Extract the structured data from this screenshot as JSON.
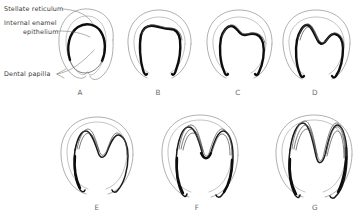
{
  "figure": {
    "background_color": "#ffffff",
    "ink_color": "#0d0d0d",
    "outline_color": "#8d8d8d",
    "label_color": "#3a3a3a",
    "letter_color": "#6a6a6a"
  },
  "annotations": [
    {
      "id": "stellate-reticulum",
      "text": "Stellate reticulum",
      "x": 4,
      "y": 10,
      "leader": "M 62 8 C 76 9, 86 14, 92 22"
    },
    {
      "id": "internal-enamel-epithelium",
      "text_line1": "Internal enamel",
      "text_line2": "epithelium",
      "x1": 4,
      "y1": 24,
      "x2": 24,
      "y2": 33,
      "leader": "M 61 30 C 74 30, 82 32, 88 36"
    },
    {
      "id": "dental-papilla",
      "text": "Dental papilla",
      "x": 4,
      "y": 75,
      "leader": "M 60 73 C 72 71, 84 62, 94 50"
    }
  ],
  "panels": [
    {
      "letter": "A",
      "name": "cap-stage",
      "letter_x": 80,
      "letter_y": 95,
      "description": "Cap stage: rounded enamel organ with thick arched internal enamel epithelium over the dental papilla."
    },
    {
      "letter": "B",
      "name": "early-bell-stage",
      "letter_x": 158,
      "letter_y": 95,
      "description": "Early bell stage: flattening of the epithelial arch with two descending cervical loops."
    },
    {
      "letter": "C",
      "name": "asymmetric-folding-stage",
      "letter_x": 238,
      "letter_y": 95,
      "description": "Asymmetric folding: first cusp elevation appears on one side of the epithelial sheet."
    },
    {
      "letter": "D",
      "name": "two-cusp-stage",
      "letter_x": 315,
      "letter_y": 95,
      "description": "Two cusps defined with a central intercuspal valley."
    },
    {
      "letter": "E",
      "name": "cusp-deepening-stage",
      "letter_x": 97,
      "letter_y": 210,
      "description": "Cusps deepen; internal enamel epithelium assumes an M-shaped profile."
    },
    {
      "letter": "F",
      "name": "layered-differentiation-stage",
      "letter_x": 197,
      "letter_y": 210,
      "description": "Layered differentiation: multiple epithelial laminae parallel the folded sheet."
    },
    {
      "letter": "G",
      "name": "crown-completion-stage",
      "letter_x": 315,
      "letter_y": 210,
      "description": "Crown pattern complete with tall sharp cusps and long cervical extensions."
    }
  ]
}
